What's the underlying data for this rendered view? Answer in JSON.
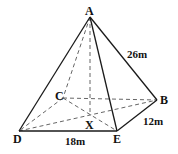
{
  "diagram": {
    "type": "rectangular pyramid",
    "vertices": {
      "A": {
        "label": "A",
        "x": 90,
        "y": 17
      },
      "B": {
        "label": "B",
        "x": 157,
        "y": 100
      },
      "C": {
        "label": "C",
        "x": 63,
        "y": 98
      },
      "D": {
        "label": "D",
        "x": 19,
        "y": 131
      },
      "E": {
        "label": "E",
        "x": 117,
        "y": 131
      },
      "X": {
        "label": "X",
        "x": 90,
        "y": 114
      }
    },
    "measurements": {
      "AB": "26m",
      "EB": "12m",
      "DE": "18m"
    },
    "labels": {
      "A": "A",
      "B": "B",
      "C": "C",
      "D": "D",
      "E": "E",
      "X": "X"
    }
  }
}
